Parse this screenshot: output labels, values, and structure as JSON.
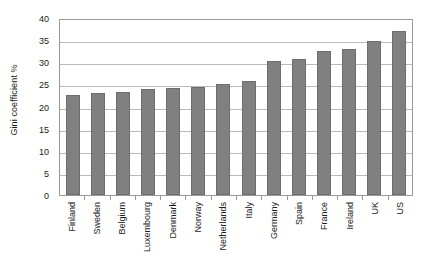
{
  "chart_data": {
    "type": "bar",
    "title": "",
    "subtitle": "",
    "xlabel": "",
    "ylabel": "Gini coefficient %",
    "ylim": [
      0,
      40
    ],
    "y_ticks": [
      0,
      5,
      10,
      15,
      20,
      25,
      30,
      35,
      40
    ],
    "grid": true,
    "legend": null,
    "legend_position": "none",
    "bar_color": "#808080",
    "bar_border_color": "#6e6e6e",
    "plot_border_color": "#9a9a9a",
    "gridline_color": "#b9b9b9",
    "background_color": "#ffffff",
    "categories": [
      "Finland",
      "Sweden",
      "Belgium",
      "Luxembourg",
      "Denmark",
      "Norway",
      "Netherlands",
      "Italy",
      "Germany",
      "Spain",
      "France",
      "Ireland",
      "UK",
      "US"
    ],
    "values": [
      22.5,
      23.1,
      23.3,
      23.9,
      24.2,
      24.5,
      25.2,
      25.7,
      30.2,
      30.8,
      32.5,
      33.0,
      34.8,
      37.0
    ]
  }
}
